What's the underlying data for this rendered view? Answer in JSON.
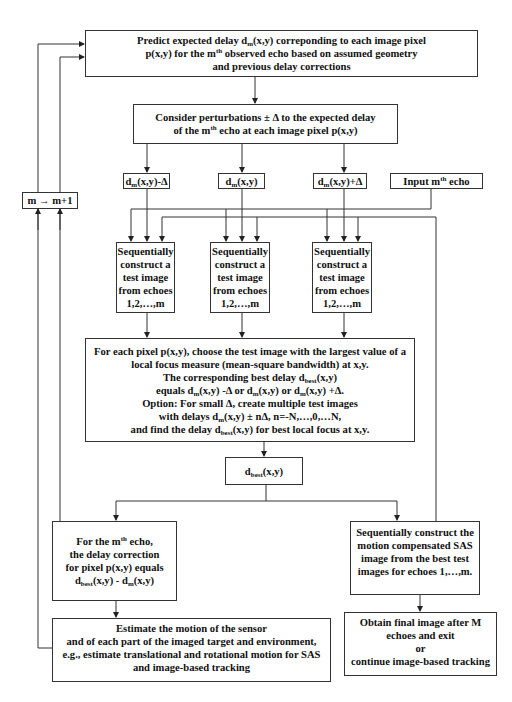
{
  "diagram": {
    "type": "flowchart",
    "nodes": {
      "predict": {
        "lines": [
          "Predict expected delay d_m(x,y) correponding to each image pixel",
          "p(x,y) for the m^th observed echo based on assumed geometry",
          "and previous delay corrections"
        ]
      },
      "consider": {
        "lines": [
          "Consider perturbations ± Δ to the expected delay",
          "of the m^th echo at each image pixel p(x,y)"
        ]
      },
      "delay_minus": {
        "label": "d_m(x,y)-Δ"
      },
      "delay_center": {
        "label": "d_m(x,y)"
      },
      "delay_plus": {
        "label": "d_m(x,y)+Δ"
      },
      "input_echo": {
        "label": "Input m^th echo"
      },
      "increment": {
        "label": "m → m+1"
      },
      "seq_test": {
        "lines": [
          "Sequentially",
          "construct a",
          "test image",
          "from echoes",
          "1,2,…,m"
        ]
      },
      "choose": {
        "lines": [
          "For each pixel p(x,y), choose the test image with the largest value of a",
          "local focus measure (mean-square bandwidth) at x,y.",
          "The corresponding best delay d_best(x,y)",
          "equals d_m(x,y) -Δ or d_m(x,y) or d_m(x,y) +Δ.",
          "Option: For small Δ, create multiple test images",
          "with delays d_m(x,y) ± nΔ, n=-N,…,0,…N,",
          "and find the delay d_best(x,y) for best local focus at x,y."
        ]
      },
      "dbest": {
        "label": "d_best(x,y)"
      },
      "correction": {
        "lines": [
          "For the m^th echo,",
          "the delay correction",
          "for pixel p(x,y) equals",
          "d_best(x,y) - d_m(x,y)"
        ]
      },
      "sas": {
        "lines": [
          "Sequentially construct the",
          "motion compensated SAS",
          "image from the best test",
          "images for  echoes 1,…,m."
        ]
      },
      "estimate": {
        "lines": [
          "Estimate the motion of the sensor",
          "and of each part of the imaged target and environment,",
          "e.g., estimate translational and rotational motion for SAS",
          "and image-based tracking"
        ]
      },
      "final": {
        "lines": [
          "Obtain final image after M",
          "echoes and exit",
          "or",
          "continue image-based tracking"
        ]
      }
    },
    "edges": [
      [
        "predict",
        "consider"
      ],
      [
        "consider",
        "delay_minus"
      ],
      [
        "consider",
        "delay_center"
      ],
      [
        "consider",
        "delay_plus"
      ],
      [
        "delay_minus",
        "seq_test_1"
      ],
      [
        "delay_center",
        "seq_test_2"
      ],
      [
        "delay_plus",
        "seq_test_3"
      ],
      [
        "input_echo",
        "seq_test_1"
      ],
      [
        "input_echo",
        "seq_test_2"
      ],
      [
        "input_echo",
        "seq_test_3"
      ],
      [
        "sas",
        "seq_test_1"
      ],
      [
        "sas",
        "seq_test_2"
      ],
      [
        "sas",
        "seq_test_3"
      ],
      [
        "seq_test_1",
        "choose"
      ],
      [
        "seq_test_2",
        "choose"
      ],
      [
        "seq_test_3",
        "choose"
      ],
      [
        "choose",
        "dbest"
      ],
      [
        "dbest",
        "correction"
      ],
      [
        "dbest",
        "sas"
      ],
      [
        "correction",
        "estimate"
      ],
      [
        "correction",
        "increment"
      ],
      [
        "estimate",
        "increment"
      ],
      [
        "increment",
        "predict"
      ],
      [
        "sas",
        "final"
      ]
    ]
  }
}
